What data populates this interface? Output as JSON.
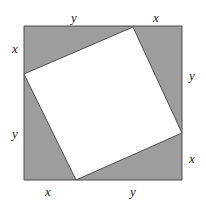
{
  "figure": {
    "name": "tilted-square-inscribed-in-square",
    "canvas": {
      "width": 206,
      "height": 207
    },
    "background_color": "#ffffff",
    "outer_square": {
      "name": "outer-square",
      "fill_color": "#9d9d9d",
      "stroke_color": "#4d4d4d",
      "stroke_width": 1,
      "left": 24,
      "top": 26,
      "right": 182,
      "bottom": 180,
      "points": "24,26 182,26 182,180 24,180"
    },
    "inner_square": {
      "name": "inner-tilted-square",
      "fill_color": "#ffffff",
      "stroke_color": "#4d4d4d",
      "stroke_width": 1,
      "points": "133,27 182,133 76,180 24,74",
      "vertices": [
        {
          "name": "top-vertex",
          "x": 133,
          "y": 27
        },
        {
          "name": "right-vertex",
          "x": 182,
          "y": 133
        },
        {
          "name": "bottom-vertex",
          "x": 76,
          "y": 180
        },
        {
          "name": "left-vertex",
          "x": 24,
          "y": 74
        }
      ]
    },
    "labels": [
      {
        "name": "label-top-y",
        "text": "y",
        "x": 74,
        "y": 17
      },
      {
        "name": "label-top-x",
        "text": "x",
        "x": 156,
        "y": 17
      },
      {
        "name": "label-left-x",
        "text": "x",
        "x": 15,
        "y": 48
      },
      {
        "name": "label-left-y",
        "text": "y",
        "x": 15,
        "y": 133
      },
      {
        "name": "label-right-y",
        "text": "y",
        "x": 192,
        "y": 75
      },
      {
        "name": "label-right-x",
        "text": "x",
        "x": 192,
        "y": 158
      },
      {
        "name": "label-bottom-x",
        "text": "x",
        "x": 48,
        "y": 191
      },
      {
        "name": "label-bottom-y",
        "text": "y",
        "x": 133,
        "y": 191
      }
    ]
  }
}
